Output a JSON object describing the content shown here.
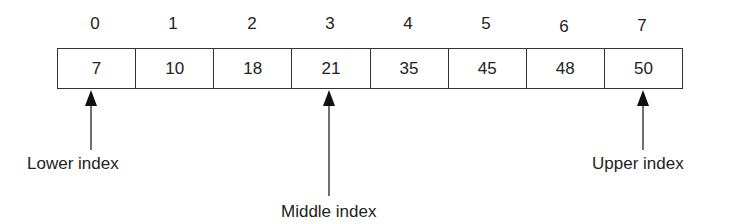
{
  "diagram": {
    "type": "binary-search-array",
    "indices": [
      "0",
      "1",
      "2",
      "3",
      "4",
      "5",
      "6",
      "7"
    ],
    "values": [
      "7",
      "10",
      "18",
      "21",
      "35",
      "45",
      "48",
      "50"
    ],
    "pointers": {
      "lower": {
        "label": "Lower index",
        "index": 0
      },
      "middle": {
        "label": "Middle index",
        "index": 3
      },
      "upper": {
        "label": "Upper index",
        "index": 7
      }
    },
    "colors": {
      "stroke": "#333333",
      "text": "#222222",
      "background": "#ffffff"
    }
  }
}
